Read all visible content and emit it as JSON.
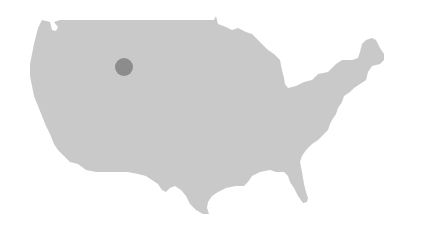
{
  "map": {
    "region": "Contiguous United States",
    "land_color": "#c9c9c9",
    "background_color": "#ffffff",
    "markers": [
      {
        "name": "location-marker",
        "cx": 124,
        "cy": 67,
        "r": 9,
        "color": "#8c8c8c"
      }
    ]
  }
}
